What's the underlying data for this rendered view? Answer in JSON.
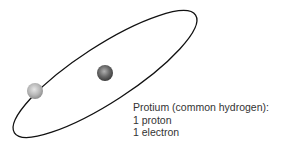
{
  "diagram": {
    "label": {
      "line1": "Protium (common hydrogen):",
      "line2": "1 proton",
      "line3": "1 electron"
    },
    "colors": {
      "orbit": "#111111",
      "proton": "#6a6a6a",
      "electron": "#b5b5b5",
      "text": "#333333"
    }
  }
}
